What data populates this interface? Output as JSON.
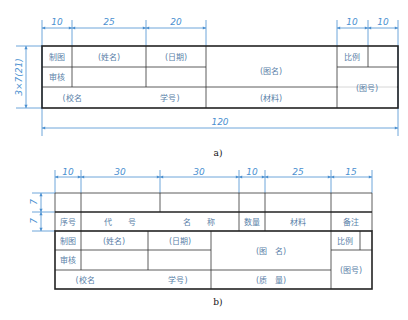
{
  "figure_a": {
    "caption": "a)",
    "dims_top": [
      "10",
      "25",
      "20",
      "10",
      "10"
    ],
    "dim_total": "120",
    "dim_left": "3×7(21)",
    "cells": {
      "drawn": "制图",
      "name": "(姓名)",
      "date": "(日期)",
      "checked": "审核",
      "drawing_name": "(图名)",
      "scale": "比例",
      "school": "(校名",
      "student_id": "学号)",
      "material": "(材料)",
      "drawing_no": "(图号)"
    }
  },
  "figure_b": {
    "caption": "b)",
    "dims_top": [
      "10",
      "30",
      "30",
      "10",
      "25",
      "15"
    ],
    "dims_left": [
      "7",
      "7"
    ],
    "parts_header": [
      "序号",
      "代　　号",
      "名　　称",
      "数量",
      "材料",
      "备注"
    ],
    "cells": {
      "drawn": "制图",
      "name": "(姓名)",
      "date": "(日期)",
      "checked": "审核",
      "drawing_name": "(图　名)",
      "scale": "比例",
      "school": "(校名",
      "student_id": "学号)",
      "mass": "(质　量)",
      "drawing_no": "(图号)"
    }
  }
}
